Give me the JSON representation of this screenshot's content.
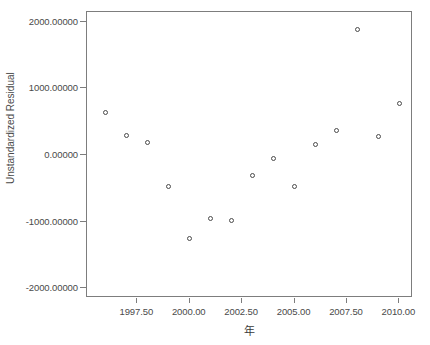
{
  "chart_data": {
    "type": "scatter",
    "title": "",
    "xlabel": "年",
    "ylabel": "Unstandardized Residual",
    "xlim": [
      1995.1,
      2010.65
    ],
    "ylim": [
      -2150,
      2150
    ],
    "grid": false,
    "legend": "none",
    "marker": "open-circle",
    "xticks": [
      1997.5,
      2000.0,
      2002.5,
      2005.0,
      2007.5,
      2010.0
    ],
    "xtick_labels": [
      "1997.50",
      "2000.00",
      "2002.50",
      "2005.00",
      "2007.50",
      "2010.00"
    ],
    "yticks": [
      2000,
      1000,
      0,
      -1000,
      -2000
    ],
    "ytick_labels": [
      "2000.00000",
      "1000.00000",
      "0.00000",
      "-1000.00000",
      "-2000.00000"
    ],
    "x": [
      1996,
      1997,
      1998,
      1999,
      2000,
      2001,
      2002,
      2003,
      2004,
      2005,
      2006,
      2007,
      2008,
      2009,
      2010
    ],
    "values": [
      640,
      290,
      190,
      -480,
      -1255,
      -960,
      -990,
      -310,
      -55,
      -470,
      165,
      370,
      1880,
      285,
      780
    ],
    "points": [
      {
        "x": 1996,
        "y": 640
      },
      {
        "x": 1997,
        "y": 290
      },
      {
        "x": 1998,
        "y": 190
      },
      {
        "x": 1999,
        "y": -480
      },
      {
        "x": 2000,
        "y": -1255
      },
      {
        "x": 2001,
        "y": -960
      },
      {
        "x": 2002,
        "y": -990
      },
      {
        "x": 2003,
        "y": -310
      },
      {
        "x": 2004,
        "y": -55
      },
      {
        "x": 2005,
        "y": -470
      },
      {
        "x": 2006,
        "y": 165
      },
      {
        "x": 2007,
        "y": 370
      },
      {
        "x": 2008,
        "y": 1880
      },
      {
        "x": 2009,
        "y": 285
      },
      {
        "x": 2010,
        "y": 780
      }
    ]
  },
  "colors": {
    "marker_stroke": "#4a4a4a",
    "frame": "#7d7d7d",
    "text": "#3a3a3a",
    "background": "#ffffff"
  }
}
